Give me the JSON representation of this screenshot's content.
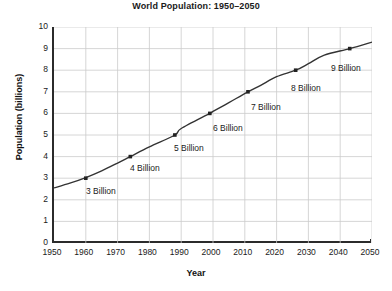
{
  "chart_data": {
    "type": "line",
    "title": "World Population: 1950–2050",
    "xlabel": "Year",
    "ylabel": "Population (billions)",
    "xlim": [
      1950,
      2050
    ],
    "ylim": [
      0,
      10
    ],
    "xticks": [
      1950,
      1960,
      1970,
      1980,
      1990,
      2000,
      2010,
      2020,
      2030,
      2040,
      2050
    ],
    "yticks": [
      0,
      1,
      2,
      3,
      4,
      5,
      6,
      7,
      8,
      9,
      10
    ],
    "grid": true,
    "legend": "none",
    "line_color": "#333333",
    "grid_color": "#cccccc",
    "axis_color": "#2b2b2b",
    "series": [
      {
        "name": "World population",
        "x": [
          1950,
          1955,
          1960,
          1965,
          1970,
          1974,
          1980,
          1988,
          1990,
          1999,
          2000,
          2005,
          2011,
          2015,
          2020,
          2026,
          2030,
          2035,
          2043,
          2050
        ],
        "values": [
          2.55,
          2.77,
          3.03,
          3.34,
          3.7,
          4.0,
          4.45,
          5.0,
          5.3,
          6.0,
          6.09,
          6.5,
          7.0,
          7.3,
          7.7,
          8.0,
          8.3,
          8.7,
          9.0,
          9.3
        ]
      }
    ],
    "markers": [
      {
        "label": "3 Billion",
        "x": 1960,
        "y": 3.0
      },
      {
        "label": "4 Billion",
        "x": 1974,
        "y": 4.0
      },
      {
        "label": "5 Billion",
        "x": 1988,
        "y": 5.0
      },
      {
        "label": "6 Billion",
        "x": 1999,
        "y": 6.0
      },
      {
        "label": "7 Billion",
        "x": 2011,
        "y": 7.0
      },
      {
        "label": "8 Billion",
        "x": 2026,
        "y": 8.0
      },
      {
        "label": "9 Billion",
        "x": 2043,
        "y": 9.0
      }
    ],
    "annotations": [
      {
        "text": "3 Billion",
        "px": 86,
        "py": 186
      },
      {
        "text": "4 Billion",
        "px": 130,
        "py": 163
      },
      {
        "text": "5 Billion",
        "px": 174,
        "py": 143
      },
      {
        "text": "6 Billion",
        "px": 213,
        "py": 123
      },
      {
        "text": "7 Billion",
        "px": 251,
        "py": 102
      },
      {
        "text": "8 Billion",
        "px": 291,
        "py": 83
      },
      {
        "text": "9 Billion",
        "px": 331,
        "py": 63
      }
    ]
  }
}
